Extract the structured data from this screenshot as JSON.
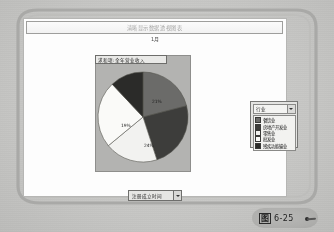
{
  "document": {
    "figure_caption_prefix": "图",
    "figure_caption_number": "6-25"
  },
  "window": {
    "title": "清晰显示数据透视图表"
  },
  "chart_panel": {
    "month_label": "1月",
    "chart_title": "求和项:全年营业收入",
    "bottom_filter": {
      "label": "注册成立时间",
      "dropdown_icon": "chevron-down-icon"
    }
  },
  "legend_panel": {
    "header_label": "行业",
    "header_dropdown_icon": "chevron-down-icon",
    "items": [
      {
        "label": "餐饮业",
        "color": "#6b6b69"
      },
      {
        "label": "房地产开发业",
        "color": "#3d3d3b"
      },
      {
        "label": "零售业",
        "color": "#f2f2f0"
      },
      {
        "label": "批发业",
        "color": "#fafaf8"
      },
      {
        "label": "残疾功能输业",
        "color": "#2b2b29"
      }
    ]
  },
  "chart_data": {
    "type": "pie",
    "title": "求和项:全年营业收入",
    "categories": [
      "餐饮业",
      "房地产开发业",
      "零售业",
      "批发业",
      "残疾功能输业"
    ],
    "values": [
      21,
      24,
      19,
      24,
      12
    ],
    "labels": [
      "21%",
      "24%",
      "19%",
      "24%",
      ""
    ],
    "colors": [
      "#6b6b69",
      "#3d3d3b",
      "#f2f2f0",
      "#fafaf8",
      "#2b2b29"
    ],
    "legend_position": "right",
    "grid": false,
    "xlabel": "",
    "ylabel": ""
  }
}
